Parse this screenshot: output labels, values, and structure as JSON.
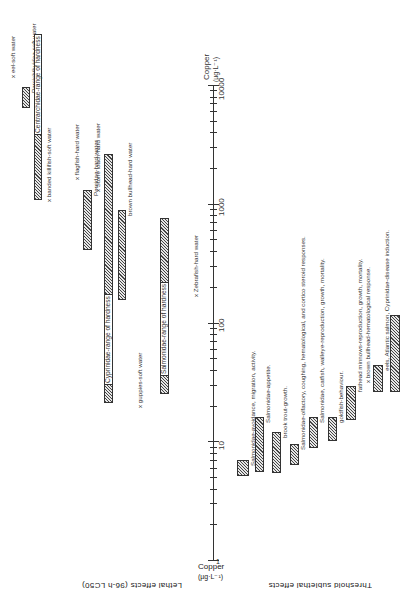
{
  "chart_data": {
    "type": "range-bar",
    "orientation": "rotated-90",
    "axis": {
      "label": "Copper (µg·L⁻¹)",
      "scale": "log",
      "ticks": [
        "1",
        "10",
        "100",
        "1000",
        "10000"
      ],
      "range": [
        1,
        10000
      ]
    },
    "sections": [
      {
        "title": "Lethal effects (96-h LC50)",
        "items": [
          {
            "label": "x eel-soft water",
            "kind": "point",
            "value": 12000
          },
          {
            "label": "Percichthyidae-soft water",
            "kind": "range",
            "low": 6400,
            "high": 9600
          },
          {
            "label": "Centrarchidae-range of hardness",
            "kind": "range",
            "low": 1070,
            "high": 12600
          },
          {
            "label": "x banded killifish-soft water",
            "kind": "point",
            "value": 1070
          },
          {
            "label": "x flagfish-hard water",
            "kind": "point",
            "value": 1650
          },
          {
            "label": "Percidae-hard water",
            "kind": "range",
            "low": 410,
            "high": 1300
          },
          {
            "label": "x Stone loach-hard water",
            "kind": "point",
            "value": 1300
          },
          {
            "label": "Cyprinidae-range of hardness",
            "kind": "range",
            "low": 21,
            "high": 2600
          },
          {
            "label": "brown bullhead-hard water",
            "kind": "range",
            "low": 155,
            "high": 890
          },
          {
            "label": "x guppies-soft water",
            "kind": "point",
            "value": 20
          },
          {
            "label": "Salmonidae-range of hardness",
            "kind": "range",
            "low": 25,
            "high": 760
          },
          {
            "label": "x Zebrafish-hard water",
            "kind": "point",
            "value": 170
          }
        ]
      },
      {
        "title": "Threshold sublethal effects",
        "items": [
          {
            "label": "Salmonidae-avoidance, migration, activity.",
            "kind": "range",
            "low": 5.1,
            "high": 7
          },
          {
            "label": "Salmonidae-appetite.",
            "kind": "range",
            "low": 5.5,
            "high": 16
          },
          {
            "label": "brook trout-growth.",
            "kind": "range",
            "low": 5.4,
            "high": 12
          },
          {
            "label": "Salmonidae-olfactory, coughing, hematological, and cortico steroid responses.",
            "kind": "range",
            "low": 6.3,
            "high": 9.5
          },
          {
            "label": "Salmonidae, catfish, walleye-reproduction, growth, mortality.",
            "kind": "range",
            "low": 8.8,
            "high": 16
          },
          {
            "label": "goldfish-behaviour.",
            "kind": "range",
            "low": 10,
            "high": 16
          },
          {
            "label": "fathead minnows-reproduction, growth, mortality.",
            "kind": "range",
            "low": 15,
            "high": 29
          },
          {
            "label": "x brown bullhead-hematological response.",
            "kind": "point",
            "value": 32
          },
          {
            "label": "eels, Atlantic salmon, Cyprinidae-disease induction.",
            "kind": "range",
            "low": 26,
            "high": 44
          },
          {
            "label": "bluegills-reproduction, growth, mortality.",
            "kind": "range",
            "low": 26,
            "high": 116
          }
        ]
      }
    ]
  },
  "labels": {
    "axis_top_unit": "Copper",
    "axis_top_unit2": "(µg·L⁻¹)",
    "axis_bottom_unit": "Copper",
    "axis_bottom_unit2": "(µg·L⁻¹)",
    "tick_1": "1",
    "tick_10": "10",
    "tick_100": "100",
    "tick_1000": "1000",
    "tick_10000": "10000",
    "lethal_title": "Lethal effects (96-h LC50)",
    "sublethal_title": "Threshold sublethal effects"
  }
}
